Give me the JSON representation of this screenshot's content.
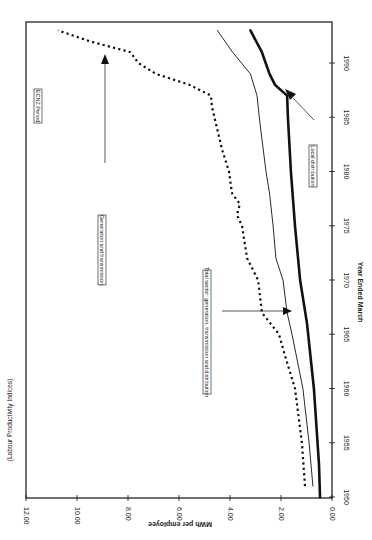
{
  "chart_data": {
    "type": "line",
    "title": "(Labour Productivity Indices)",
    "xlabel": "Year Ended March",
    "ylabel": "MWh per employee",
    "xlim": [
      1950,
      1993
    ],
    "ylim": [
      0,
      12
    ],
    "x_ticks": [
      "1950",
      "1955",
      "1960",
      "1965",
      "1970",
      "1975",
      "1980",
      "1985",
      "1990"
    ],
    "y_ticks": [
      "0.00",
      "2.00",
      "4.00",
      "6.00",
      "8.00",
      "10.00",
      "12.00"
    ],
    "orientation": "rotated 90 degrees (x-axis on right edge, y-axis along bottom, values increase leftward)",
    "grid": false,
    "annotations": [
      {
        "text": "ECNZ Period",
        "type": "box"
      },
      {
        "text": "Generation and transmission",
        "type": "box",
        "arrow_to_series": "Generation and transmission"
      },
      {
        "text": "Total sector: generation, transmission and distribution",
        "type": "box",
        "arrow_to_series": "Total sector"
      },
      {
        "text": "Local distribution",
        "type": "box",
        "arrow_to_series": "Local distribution"
      }
    ],
    "series": [
      {
        "name": "Generation and transmission",
        "style": "dotted",
        "x": [
          1951,
          1955,
          1960,
          1963,
          1965,
          1967,
          1970,
          1972,
          1975,
          1976,
          1977,
          1978,
          1980,
          1982,
          1984,
          1986,
          1987,
          1988,
          1989,
          1990,
          1991,
          1992,
          1993
        ],
        "values": [
          1.06,
          1.18,
          1.45,
          1.84,
          2.08,
          2.75,
          2.9,
          3.33,
          3.53,
          3.73,
          3.61,
          3.92,
          4.04,
          4.31,
          4.51,
          4.71,
          4.75,
          5.6,
          6.9,
          7.6,
          7.9,
          9.5,
          10.75
        ]
      },
      {
        "name": "Total sector: generation, transmission and distribution",
        "style": "thin-solid",
        "x": [
          1951,
          1955,
          1960,
          1965,
          1967,
          1970,
          1972,
          1975,
          1978,
          1980,
          1983,
          1985,
          1987,
          1989,
          1991,
          1993
        ],
        "values": [
          0.75,
          0.9,
          1.14,
          1.57,
          1.76,
          1.92,
          2.2,
          2.31,
          2.45,
          2.59,
          2.75,
          2.85,
          2.94,
          3.2,
          3.9,
          4.5
        ]
      },
      {
        "name": "Local distribution",
        "style": "thick-solid",
        "x": [
          1950,
          1953,
          1960,
          1966,
          1970,
          1975,
          1980,
          1985,
          1987,
          1988,
          1989,
          1991,
          1993
        ],
        "values": [
          0.47,
          0.51,
          0.71,
          0.98,
          1.25,
          1.45,
          1.61,
          1.73,
          1.76,
          2.24,
          2.45,
          2.75,
          3.2
        ]
      }
    ]
  },
  "labels": {
    "title": "(Labour Productivity Indices)",
    "xlabel": "Year Ended March",
    "ylabel": "MWh per employee",
    "ecnz": "ECNZ Period",
    "gen_trans": "Generation and transmission",
    "total": "Total sector: generation, transmission and distribution",
    "local": "Local distribution"
  },
  "colors": {
    "line": "#111111",
    "frame": "#111111",
    "background": "#ffffff"
  }
}
